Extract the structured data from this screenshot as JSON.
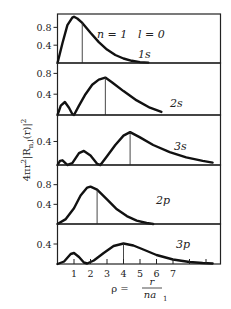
{
  "chart_data": {
    "type": "line",
    "title": "",
    "xlabel": "ρ = r / n a₁",
    "ylabel": "4πr²|R_n,l(r)|²",
    "x_tick_labels": [
      "1",
      "2",
      "3",
      "4",
      "5",
      "6",
      "7"
    ],
    "xlim": [
      0,
      9.8
    ],
    "grid": false,
    "legend": "none (inline labels in each panel)",
    "header_annotation": {
      "n": "n = 1",
      "l": "l = 0"
    },
    "panels": [
      {
        "name": "1s",
        "label": "1s",
        "y_tick_labels": [
          "0.8",
          "0.4"
        ],
        "y_ticks": [
          0.8,
          0.4
        ],
        "ylim": [
          0,
          1.1
        ],
        "peak_marker_x": 1.5,
        "x": [
          0,
          0.3,
          0.6,
          0.9,
          1.0,
          1.2,
          1.5,
          2.0,
          2.5,
          3.0,
          3.5,
          4.0,
          4.5,
          5.0,
          5.5
        ],
        "y": [
          0,
          0.45,
          0.85,
          1.02,
          1.04,
          1.0,
          0.9,
          0.68,
          0.47,
          0.3,
          0.18,
          0.1,
          0.05,
          0.02,
          0.01
        ]
      },
      {
        "name": "2s",
        "label": "2s",
        "y_tick_labels": [
          "0.8",
          "0.4"
        ],
        "y_ticks": [
          0.8,
          0.4
        ],
        "ylim": [
          0,
          1.0
        ],
        "peak_marker_x": 2.9,
        "x": [
          0,
          0.2,
          0.45,
          0.7,
          0.9,
          1.0,
          1.3,
          1.7,
          2.1,
          2.5,
          2.9,
          3.3,
          4.0,
          4.8,
          5.6,
          6.3
        ],
        "y": [
          0,
          0.18,
          0.25,
          0.14,
          0.02,
          0.0,
          0.18,
          0.4,
          0.58,
          0.68,
          0.72,
          0.63,
          0.46,
          0.28,
          0.14,
          0.06
        ]
      },
      {
        "name": "3s",
        "label": "3s",
        "y_tick_labels": [
          "0.4"
        ],
        "y_ticks": [
          0.4
        ],
        "ylim": [
          0,
          0.85
        ],
        "peak_marker_x": 4.4,
        "x": [
          0,
          0.15,
          0.3,
          0.45,
          0.6,
          0.9,
          1.3,
          1.6,
          2.0,
          2.4,
          2.6,
          3.0,
          3.5,
          4.0,
          4.4,
          5.0,
          5.8,
          6.8,
          7.8,
          8.8,
          9.4
        ],
        "y": [
          0,
          0.07,
          0.08,
          0.04,
          0.0,
          0.03,
          0.2,
          0.24,
          0.16,
          0.02,
          0.0,
          0.15,
          0.34,
          0.5,
          0.56,
          0.47,
          0.34,
          0.22,
          0.13,
          0.07,
          0.04
        ]
      },
      {
        "name": "2p",
        "label": "2p",
        "y_tick_labels": [
          "0.8",
          "0.4"
        ],
        "y_ticks": [
          0.8,
          0.4
        ],
        "ylim": [
          0,
          1.2
        ],
        "peak_marker_x": 2.4,
        "x": [
          0,
          0.5,
          1.0,
          1.4,
          1.8,
          2.0,
          2.4,
          3.0,
          3.6,
          4.2,
          4.8,
          5.4,
          5.8
        ],
        "y": [
          0,
          0.1,
          0.32,
          0.58,
          0.74,
          0.76,
          0.7,
          0.5,
          0.3,
          0.16,
          0.07,
          0.02,
          0.0
        ]
      },
      {
        "name": "3p",
        "label": "3p",
        "y_tick_labels": [
          "0.4"
        ],
        "y_ticks": [
          0.4
        ],
        "ylim": [
          0,
          0.8
        ],
        "peak_marker_x": 4.0,
        "x": [
          0,
          0.4,
          0.8,
          1.0,
          1.3,
          1.6,
          1.8,
          2.2,
          2.8,
          3.4,
          4.0,
          4.6,
          5.2,
          6.0,
          7.0,
          8.0,
          8.8,
          9.4
        ],
        "y": [
          0,
          0.05,
          0.2,
          0.22,
          0.14,
          0.03,
          0.01,
          0.07,
          0.22,
          0.36,
          0.41,
          0.37,
          0.29,
          0.18,
          0.09,
          0.04,
          0.02,
          0.01
        ]
      }
    ]
  }
}
